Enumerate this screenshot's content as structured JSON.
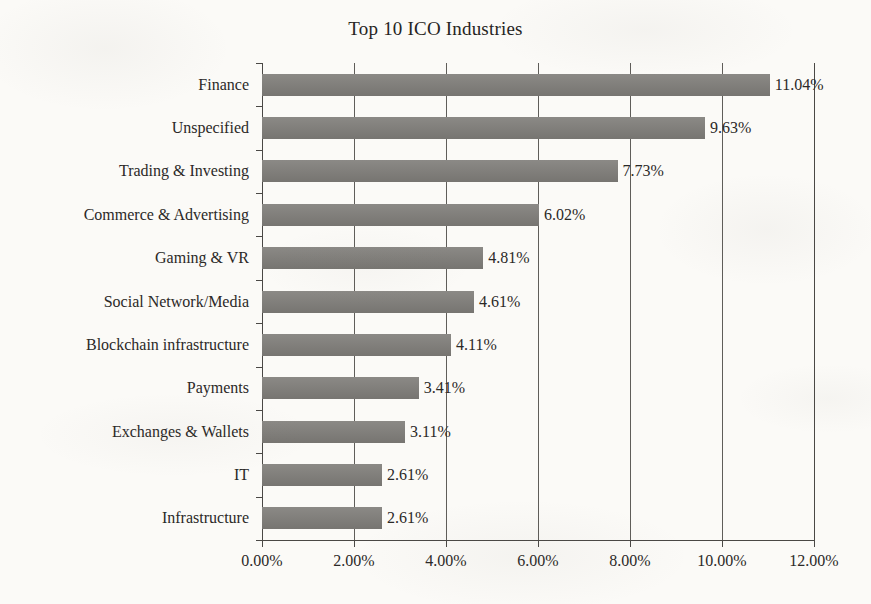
{
  "chart_data": {
    "type": "bar",
    "orientation": "horizontal",
    "title": "Top 10 ICO Industries",
    "xlabel": "",
    "ylabel": "",
    "categories": [
      "Finance",
      "Unspecified",
      "Trading & Investing",
      "Commerce & Advertising",
      "Gaming & VR",
      "Social Network/Media",
      "Blockchain infrastructure",
      "Payments",
      "Exchanges & Wallets",
      "IT",
      "Infrastructure"
    ],
    "values": [
      11.04,
      9.63,
      7.73,
      6.02,
      4.81,
      4.61,
      4.11,
      3.41,
      3.11,
      2.61,
      2.61
    ],
    "data_labels": [
      "11.04%",
      "9.63%",
      "7.73%",
      "6.02%",
      "4.81%",
      "4.61%",
      "4.11%",
      "3.41%",
      "3.11%",
      "2.61%",
      "2.61%"
    ],
    "xlim": [
      0,
      12
    ],
    "xticks": [
      0,
      2,
      4,
      6,
      8,
      10,
      12
    ],
    "xtick_labels": [
      "0.00%",
      "2.00%",
      "4.00%",
      "6.00%",
      "8.00%",
      "10.00%",
      "12.00%"
    ],
    "grid": "vertical",
    "legend": null,
    "bar_color": "#7e7c78",
    "axis_color": "#4a4845",
    "background_color": "#fbfaf7",
    "text_color": "#2b2927"
  }
}
